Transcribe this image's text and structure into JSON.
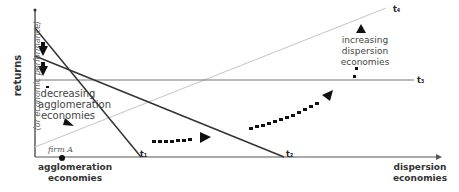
{
  "diagram": {
    "y_axis": {
      "label": "returns",
      "sublabel": "(or economic performance)"
    },
    "x_axis": {
      "left_label": [
        "agglomeration",
        "economies"
      ],
      "right_label": [
        "dispersion",
        "economies"
      ]
    },
    "lines": [
      {
        "name": "t1",
        "label": "t₁"
      },
      {
        "name": "t2",
        "label": "t₂"
      },
      {
        "name": "t3",
        "label": "t₃"
      },
      {
        "name": "t4",
        "label": "t₄"
      }
    ],
    "annotations": {
      "decreasing": [
        "decreasing",
        "agglomeration",
        "economies"
      ],
      "increasing": [
        "increasing",
        "dispersion",
        "economies"
      ],
      "firm": "firm A"
    }
  }
}
